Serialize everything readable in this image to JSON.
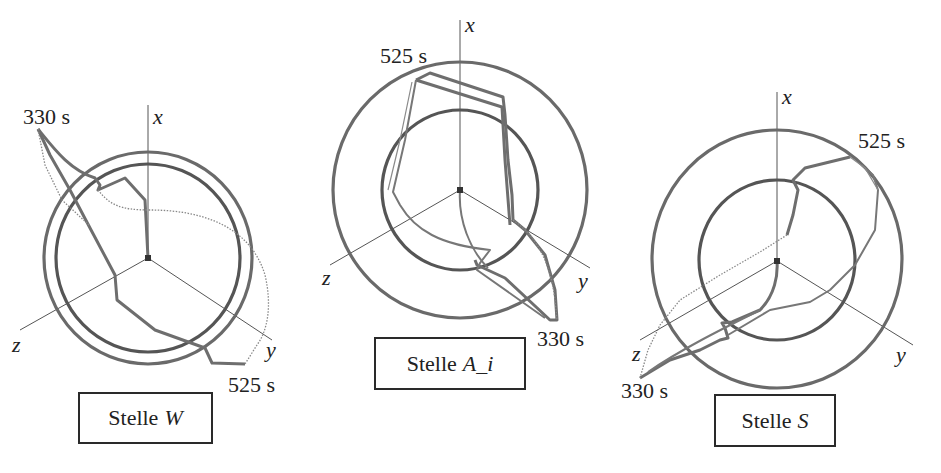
{
  "figure": {
    "type": "3d-trajectory-diagram",
    "colors": {
      "axis": "#555555",
      "ring": "#6a6a6a",
      "trajectory": "#6e6e6e",
      "text": "#222222"
    },
    "panels": [
      {
        "id": "W",
        "caption_prefix": "Stelle",
        "caption_var": "W",
        "axes": {
          "x": "x",
          "y": "y",
          "z": "z"
        },
        "start_label": "330 s",
        "end_label": "525 s"
      },
      {
        "id": "A_i",
        "caption_prefix": "Stelle",
        "caption_var": "A_i",
        "axes": {
          "x": "x",
          "y": "y",
          "z": "z"
        },
        "start_label": "330 s",
        "end_label": "525 s"
      },
      {
        "id": "S",
        "caption_prefix": "Stelle",
        "caption_var": "S",
        "axes": {
          "x": "x",
          "y": "y",
          "z": "z"
        },
        "start_label": "330 s",
        "end_label": "525 s"
      }
    ]
  }
}
